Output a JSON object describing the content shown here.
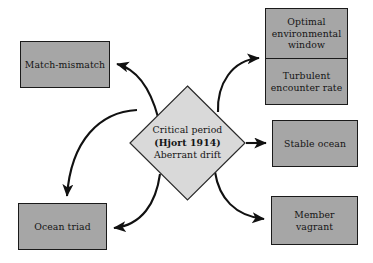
{
  "diagram": {
    "background_color": "#ffffff",
    "box_fill_color": "#a6a6a6",
    "diamond_fill_color": "#d9d9d9",
    "stroke_color": "#1a1a1a",
    "text_color": "#141414",
    "center": {
      "line1": "Critical period",
      "line2": "(Hjort 1914)",
      "line3": "Aberrant drift"
    },
    "nodes": {
      "match_mismatch": "Match-mismatch",
      "ocean_triad": "Ocean triad",
      "optimal_environmental_window": {
        "line1": "Optimal",
        "line2": "environmental",
        "line3": "window"
      },
      "turbulent_encounter_rate": {
        "line1": "Turbulent",
        "line2": "encounter rate"
      },
      "stable_ocean": "Stable ocean",
      "member_vagrant": "Member vagrant"
    },
    "edges": [
      {
        "name": "critical-period-to-match-mismatch",
        "from": "Critical period (Hjort 1914) Aberrant drift",
        "to": "Match-mismatch",
        "style": "curved-arrow"
      },
      {
        "name": "critical-period-to-ocean-triad-top",
        "from": "Critical period (Hjort 1914) Aberrant drift",
        "to": "Ocean triad",
        "style": "curved-arrow"
      },
      {
        "name": "critical-period-to-ocean-triad-right",
        "from": "Critical period (Hjort 1914) Aberrant drift",
        "to": "Ocean triad",
        "style": "curved-arrow"
      },
      {
        "name": "critical-period-to-optimal-environmental-window",
        "from": "Critical period (Hjort 1914) Aberrant drift",
        "to": "Optimal environmental window / Turbulent encounter rate",
        "style": "curved-arrow"
      },
      {
        "name": "critical-period-to-stable-ocean",
        "from": "Critical period (Hjort 1914) Aberrant drift",
        "to": "Stable ocean",
        "style": "straight-arrow"
      },
      {
        "name": "critical-period-to-member-vagrant",
        "from": "Critical period (Hjort 1914) Aberrant drift",
        "to": "Member vagrant",
        "style": "curved-arrow"
      }
    ]
  }
}
